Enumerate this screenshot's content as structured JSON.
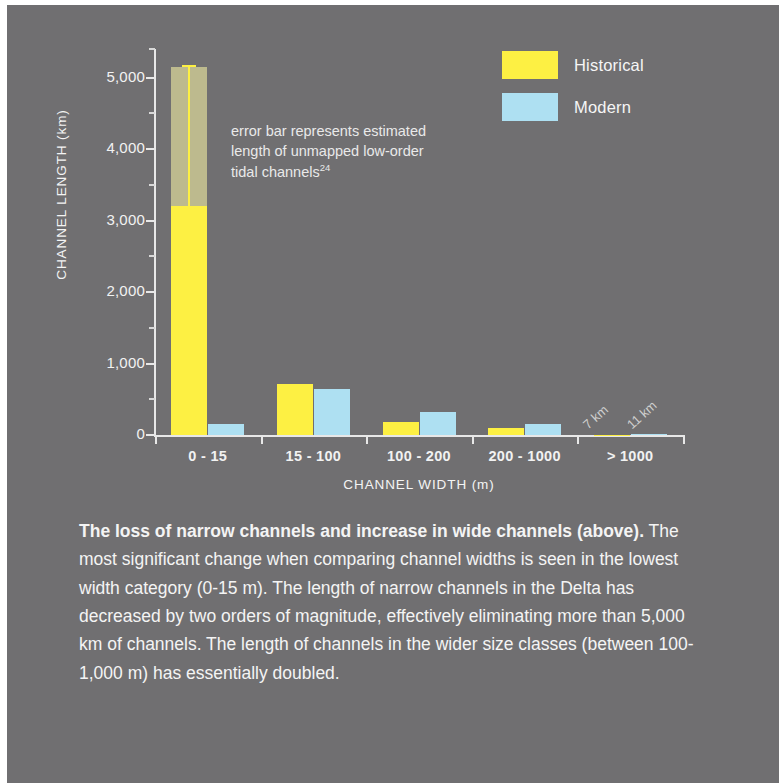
{
  "colors": {
    "background": "#706f71",
    "historical": "#fdf043",
    "modern": "#aee0f2",
    "error_band": "#d1cd96",
    "axis": "#e8e8e8",
    "text": "#f4f4f4"
  },
  "legend": {
    "items": [
      {
        "label": "Historical",
        "color": "#fdf043"
      },
      {
        "label": "Modern",
        "color": "#aee0f2"
      }
    ]
  },
  "annotation": {
    "line1": "error bar represents estimated",
    "line2": "length of unmapped low-order",
    "line3": "tidal channels",
    "superscript": "24"
  },
  "caption": {
    "bold_lead": "The loss of narrow channels and increase in wide channels (above).",
    "body": " The most significant change when comparing channel widths is seen in the lowest width category (0-15 m). The length of narrow channels in the Delta has decreased by two orders of magnitude, effectively eliminating more than 5,000 km of channels. The length of channels in the wider size classes (between 100-1,000 m) has essentially doubled."
  },
  "chart_data": {
    "type": "bar",
    "title": "",
    "xlabel": "CHANNEL WIDTH (m)",
    "ylabel": "CHANNEL LENGTH (km)",
    "categories": [
      "0 - 15",
      "15 - 100",
      "100 - 200",
      "200 - 1000",
      "> 1000"
    ],
    "series": [
      {
        "name": "Historical",
        "color": "#fdf043",
        "values": [
          3200,
          715,
          185,
          105,
          7
        ]
      },
      {
        "name": "Modern",
        "color": "#aee0f2",
        "values": [
          160,
          640,
          325,
          160,
          11
        ]
      }
    ],
    "error_bars": [
      {
        "category": "0 - 15",
        "series": "Historical",
        "low": 3200,
        "high": 5150
      }
    ],
    "point_labels": [
      {
        "category": "> 1000",
        "series": "Historical",
        "text": "7 km"
      },
      {
        "category": "> 1000",
        "series": "Modern",
        "text": "11 km"
      }
    ],
    "ylim": [
      0,
      5400
    ],
    "yticks": [
      0,
      1000,
      2000,
      3000,
      4000,
      5000
    ],
    "ytick_labels": [
      "0",
      "1,000",
      "2,000",
      "3,000",
      "4,000",
      "5,000"
    ],
    "yminor_ticks": [
      500,
      1500,
      2500,
      3500,
      4500,
      5400
    ],
    "grid": false,
    "legend_position": "top-right"
  }
}
